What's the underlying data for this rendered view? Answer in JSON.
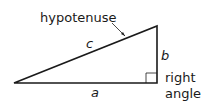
{
  "diagram": {
    "labels": {
      "hypotenuse": "hypotenuse",
      "side_c": "c",
      "side_b": "b",
      "side_a": "a",
      "right_angle_line1": "right",
      "right_angle_line2": "angle"
    },
    "colors": {
      "stroke": "#1a1a1a",
      "background": "#ffffff"
    }
  }
}
